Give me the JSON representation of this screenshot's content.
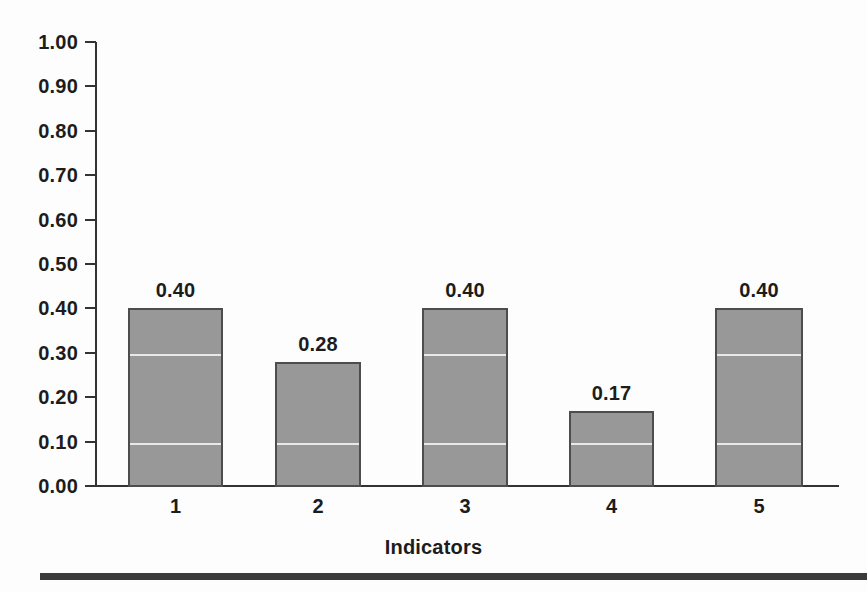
{
  "chart_data": {
    "type": "bar",
    "title": "",
    "subtitle": "",
    "categories": [
      "1",
      "2",
      "3",
      "4",
      "5"
    ],
    "values": [
      0.4,
      0.28,
      0.4,
      0.17,
      0.4
    ],
    "data_labels": [
      "0.40",
      "0.28",
      "0.40",
      "0.17",
      "0.40"
    ],
    "xlabel": "Indicators",
    "ylabel": "",
    "ylim": [
      0.0,
      1.0
    ],
    "ytick_values": [
      1.0,
      0.9,
      0.8,
      0.7,
      0.6,
      0.5,
      0.4,
      0.3,
      0.2,
      0.1,
      0.0
    ],
    "ytick_labels": [
      "1.00",
      "0.90",
      "0.80",
      "0.70",
      "0.60",
      "0.50",
      "0.40",
      "0.30",
      "0.20",
      "0.10",
      "0.00"
    ],
    "grid": false,
    "legend": null,
    "legend_position": "none",
    "series": [
      {
        "name": "Indicator score",
        "values": [
          0.4,
          0.28,
          0.4,
          0.17,
          0.4
        ]
      }
    ],
    "colors": {
      "bar_fill": "#989898",
      "bar_border": "#4d4d4d",
      "axis": "#333333",
      "text": "#1c1c1c",
      "background": "#fdfdfd",
      "bottom_rule": "#3b3b3b"
    }
  }
}
